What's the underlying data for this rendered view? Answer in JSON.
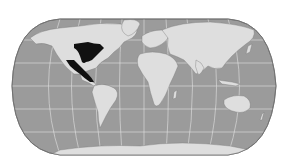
{
  "map": {
    "projection": "pseudocylindrical world map (Robinson-like)",
    "highlighted_region": "Eastern United States and Mexico / Central America",
    "colors": {
      "background": "#ffffff",
      "ocean": "#9b9b9b",
      "land": "#dedede",
      "highlight": "#111111",
      "graticule": "#e8e8e8",
      "outline": "#6e6e6e"
    },
    "graticule": {
      "meridians": 12,
      "parallels": 5
    }
  }
}
